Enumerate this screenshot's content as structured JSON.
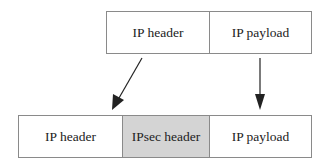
{
  "original_packet": {
    "cells": [
      {
        "label": "IP header"
      },
      {
        "label": "IP payload"
      }
    ]
  },
  "ipsec_packet": {
    "cells": [
      {
        "label": "IP header"
      },
      {
        "label": "IPsec header",
        "shaded": true
      },
      {
        "label": "IP payload"
      }
    ]
  },
  "colors": {
    "border": "#8a8a8a",
    "shaded_fill": "#d4d4d4",
    "arrow": "#222222"
  }
}
